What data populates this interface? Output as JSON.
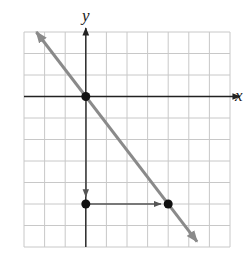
{
  "chart_data": {
    "type": "line",
    "title": "",
    "xlabel": "x",
    "ylabel": "y",
    "xlim": [
      -3,
      7
    ],
    "ylim": [
      -7,
      3
    ],
    "grid": true,
    "grid_step": 1,
    "tick_labels_shown": false,
    "line": {
      "description": "line through origin with slope -5/4",
      "slope": -1.25,
      "intercept": 0,
      "color": "#8a8a8a",
      "arrows": "both ends"
    },
    "points": [
      {
        "x": 0,
        "y": 0
      },
      {
        "x": 0,
        "y": -5
      },
      {
        "x": 4,
        "y": -5
      }
    ],
    "annotations": [
      {
        "type": "arrow",
        "from": {
          "x": 0,
          "y": 0
        },
        "to": {
          "x": 0,
          "y": -5
        },
        "meaning": "rise -5"
      },
      {
        "type": "arrow",
        "from": {
          "x": 0,
          "y": -5
        },
        "to": {
          "x": 4,
          "y": -5
        },
        "meaning": "run 4"
      }
    ]
  },
  "labels": {
    "x_axis": "x",
    "y_axis": "y"
  },
  "colors": {
    "grid": "#c8c8c8",
    "axis": "#222222",
    "line": "#8a8a8a",
    "point": "#111111",
    "annotation_arrow": "#555555"
  }
}
